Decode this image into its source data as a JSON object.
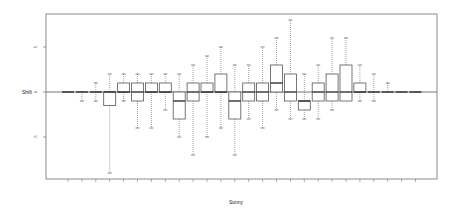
{
  "chart_data": {
    "type": "box",
    "title": "",
    "xlabel": "Sunny",
    "ylabel": "Shift",
    "ylim": [
      -10,
      8.5
    ],
    "yticks": [
      -5,
      0,
      5
    ],
    "grid": false,
    "reference_line": 0,
    "categories": [
      "1",
      "2",
      "3",
      "4",
      "5",
      "6",
      "7",
      "8",
      "9",
      "10",
      "11",
      "12",
      "13",
      "14",
      "15",
      "16",
      "17",
      "18",
      "19",
      "20",
      "21",
      "22",
      "23",
      "24",
      "25",
      "26"
    ],
    "boxes": [
      {
        "q1": 0,
        "median": 0,
        "q3": 0,
        "lo": 0,
        "hi": 0
      },
      {
        "q1": 0,
        "median": 0,
        "q3": 0,
        "lo": -1,
        "hi": 0
      },
      {
        "q1": 0,
        "median": 0,
        "q3": 0,
        "lo": -1,
        "hi": 1
      },
      {
        "q1": -1.5,
        "median": 0,
        "q3": 0,
        "lo": -9,
        "hi": 2
      },
      {
        "q1": 0,
        "median": 0,
        "q3": 1,
        "lo": -1,
        "hi": 2
      },
      {
        "q1": -1,
        "median": 0,
        "q3": 1,
        "lo": -4,
        "hi": 2
      },
      {
        "q1": 0,
        "median": 0,
        "q3": 1,
        "lo": -4,
        "hi": 2
      },
      {
        "q1": 0,
        "median": 0,
        "q3": 1,
        "lo": -2,
        "hi": 2
      },
      {
        "q1": -3,
        "median": -1,
        "q3": 0,
        "lo": -5,
        "hi": 2
      },
      {
        "q1": -1,
        "median": 0,
        "q3": 1,
        "lo": -7,
        "hi": 3
      },
      {
        "q1": 0,
        "median": 0,
        "q3": 1,
        "lo": -5,
        "hi": 4
      },
      {
        "q1": 0,
        "median": 0,
        "q3": 2,
        "lo": -4,
        "hi": 5
      },
      {
        "q1": -3,
        "median": -1,
        "q3": 0,
        "lo": -7,
        "hi": 3
      },
      {
        "q1": -1,
        "median": 0,
        "q3": 1,
        "lo": -3,
        "hi": 3
      },
      {
        "q1": -1,
        "median": 0,
        "q3": 1,
        "lo": -4,
        "hi": 5
      },
      {
        "q1": 0,
        "median": 1,
        "q3": 3,
        "lo": -2,
        "hi": 6
      },
      {
        "q1": -1,
        "median": 0,
        "q3": 2,
        "lo": -3,
        "hi": 8
      },
      {
        "q1": -2,
        "median": -1,
        "q3": -1,
        "lo": -3,
        "hi": 2
      },
      {
        "q1": -1,
        "median": 0,
        "q3": 1,
        "lo": -3,
        "hi": 3
      },
      {
        "q1": -1,
        "median": 0,
        "q3": 2,
        "lo": -2,
        "hi": 6
      },
      {
        "q1": -1,
        "median": 0,
        "q3": 3,
        "lo": -1,
        "hi": 6
      },
      {
        "q1": 0,
        "median": 0,
        "q3": 1,
        "lo": -1,
        "hi": 3
      },
      {
        "q1": 0,
        "median": 0,
        "q3": 0,
        "lo": -1,
        "hi": 2
      },
      {
        "q1": 0,
        "median": 0,
        "q3": 0,
        "lo": 0,
        "hi": 1
      },
      {
        "q1": 0,
        "median": 0,
        "q3": 0,
        "lo": 0,
        "hi": 0
      },
      {
        "q1": 0,
        "median": 0,
        "q3": 0,
        "lo": 0,
        "hi": 0
      }
    ]
  }
}
